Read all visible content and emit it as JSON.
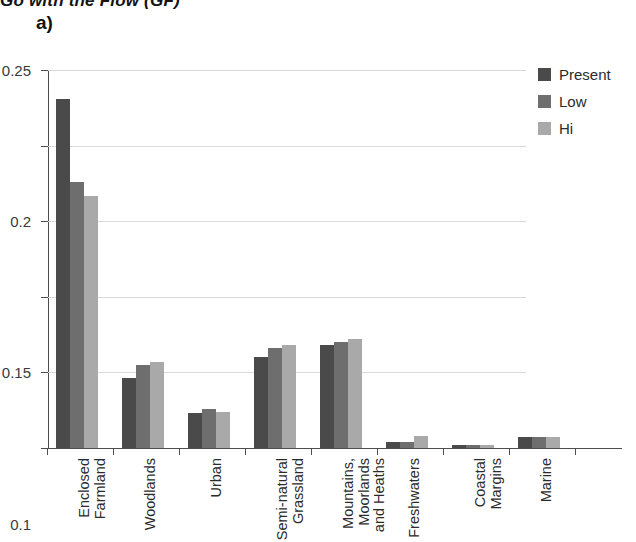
{
  "header": {
    "cropped_running_title": "Go with the Flow (GF)"
  },
  "panel": {
    "letter": "a)"
  },
  "legend": {
    "position": "top-right",
    "items": [
      {
        "label": "Present",
        "color": "#4a4a4a"
      },
      {
        "label": "Low",
        "color": "#6e6e6e"
      },
      {
        "label": "Hi",
        "color": "#a9a9a9"
      }
    ]
  },
  "chart_data": {
    "type": "bar",
    "title": "",
    "subtitle": "",
    "xlabel": "",
    "ylabel": "",
    "ylim": [
      0,
      0.25
    ],
    "yticks": [
      "0",
      "0.05",
      "0.1",
      "0.15",
      "0.2",
      "0.25"
    ],
    "ytick_values": [
      0,
      0.05,
      0.1,
      0.15,
      0.2,
      0.25
    ],
    "grid": true,
    "grid_axis": "y",
    "legend_position": "top-right",
    "categories": [
      "Enclosed Farmland",
      "Woodlands",
      "Urban",
      "Semi-natural Grassland",
      "Mountains, Moorlands and Heaths",
      "Freshwaters",
      "Coastal Margins",
      "Marine"
    ],
    "category_label_lines": [
      [
        "Enclosed",
        "Farmland"
      ],
      [
        "Woodlands"
      ],
      [
        "Urban"
      ],
      [
        "Semi-natural",
        "Grassland"
      ],
      [
        "Mountains,",
        "Moorlands",
        "and Heaths"
      ],
      [
        "Freshwaters"
      ],
      [
        "Coastal",
        "Margins"
      ],
      [
        "Marine"
      ]
    ],
    "series": [
      {
        "name": "Present",
        "color": "#4a4a4a",
        "values": [
          0.231,
          0.046,
          0.023,
          0.06,
          0.068,
          0.004,
          0.002,
          0.007
        ]
      },
      {
        "name": "Low",
        "color": "#6e6e6e",
        "values": [
          0.176,
          0.055,
          0.026,
          0.066,
          0.07,
          0.004,
          0.002,
          0.007
        ]
      },
      {
        "name": "Hi",
        "color": "#a9a9a9",
        "values": [
          0.167,
          0.057,
          0.024,
          0.068,
          0.072,
          0.008,
          0.002,
          0.007
        ]
      }
    ]
  }
}
